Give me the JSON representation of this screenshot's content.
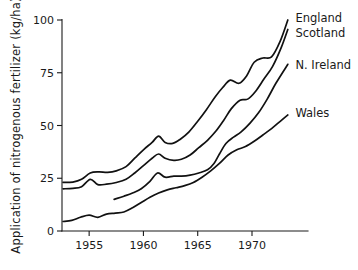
{
  "chart_data": {
    "type": "line",
    "title": "",
    "xlabel": "",
    "ylabel": "Application of nitrogenous fertilizer (kg/ha)",
    "xlim": [
      1952.5,
      1973.5
    ],
    "ylim": [
      0,
      100
    ],
    "xticks": [
      1955,
      1960,
      1965,
      1970
    ],
    "xtick_labels": [
      "1955",
      "1960",
      "1965",
      "1970"
    ],
    "yticks": [
      0,
      25,
      50,
      75,
      100
    ],
    "ytick_labels": [
      "0",
      "25",
      "50",
      "75",
      "100"
    ],
    "grid": false,
    "legend_position": "right-inline-labels",
    "line_color": "#111111",
    "series": [
      {
        "name": "England",
        "label": "England",
        "label_x": 1974.0,
        "label_y": 101.0,
        "x": [
          1952.6,
          1953.5,
          1954.3,
          1955.1,
          1955.9,
          1956.7,
          1957.5,
          1958.4,
          1959.2,
          1960.0,
          1960.8,
          1961.4,
          1962.0,
          1962.7,
          1963.4,
          1964.2,
          1965.0,
          1965.8,
          1966.6,
          1967.3,
          1968.0,
          1968.8,
          1969.5,
          1970.2,
          1971.0,
          1971.8,
          1972.6,
          1973.3
        ],
        "y": [
          23.0,
          23.2,
          24.5,
          27.5,
          28.0,
          27.8,
          28.5,
          30.5,
          34.5,
          38.5,
          42.0,
          45.0,
          42.0,
          41.5,
          43.5,
          47.0,
          52.0,
          57.5,
          63.5,
          68.0,
          71.5,
          70.0,
          73.5,
          80.0,
          82.0,
          82.5,
          90.0,
          100.0
        ]
      },
      {
        "name": "Scotland",
        "label": "Scotland",
        "label_x": 1974.0,
        "label_y": 94.0,
        "x": [
          1952.6,
          1953.5,
          1954.3,
          1955.1,
          1955.8,
          1956.6,
          1957.5,
          1958.4,
          1959.2,
          1960.0,
          1960.8,
          1961.4,
          1962.0,
          1962.8,
          1963.5,
          1964.3,
          1965.1,
          1965.9,
          1966.7,
          1967.4,
          1968.1,
          1968.9,
          1969.6,
          1970.3,
          1971.1,
          1971.9,
          1972.7,
          1973.3
        ],
        "y": [
          20.0,
          20.2,
          21.0,
          24.5,
          22.0,
          22.2,
          23.0,
          24.5,
          27.5,
          31.0,
          34.5,
          36.5,
          34.5,
          33.5,
          34.0,
          36.0,
          39.5,
          43.0,
          47.5,
          52.5,
          58.0,
          62.0,
          62.5,
          66.0,
          72.0,
          78.0,
          87.0,
          95.5
        ]
      },
      {
        "name": "N. Ireland",
        "label": "N. Ireland",
        "label_x": 1974.0,
        "label_y": 78.5,
        "x": [
          1957.3,
          1958.2,
          1959.0,
          1959.8,
          1960.6,
          1961.3,
          1962.0,
          1962.8,
          1963.5,
          1964.3,
          1965.1,
          1965.9,
          1966.5,
          1967.0,
          1967.6,
          1968.3,
          1969.0,
          1969.8,
          1970.6,
          1971.4,
          1972.2,
          1973.3
        ],
        "y": [
          15.0,
          16.5,
          18.0,
          20.0,
          23.5,
          27.5,
          25.5,
          26.0,
          26.0,
          26.5,
          27.5,
          29.0,
          32.0,
          36.5,
          41.5,
          44.5,
          47.0,
          51.0,
          56.0,
          62.5,
          70.0,
          79.0
        ]
      },
      {
        "name": "Wales",
        "label": "Wales",
        "label_x": 1974.0,
        "label_y": 56.0,
        "x": [
          1952.6,
          1953.4,
          1954.2,
          1955.0,
          1955.8,
          1956.6,
          1957.4,
          1958.2,
          1959.0,
          1959.8,
          1960.6,
          1961.4,
          1962.2,
          1963.0,
          1963.8,
          1964.6,
          1965.4,
          1966.2,
          1967.0,
          1967.8,
          1968.6,
          1969.4,
          1970.2,
          1971.0,
          1971.8,
          1972.6,
          1973.3
        ],
        "y": [
          4.5,
          5.0,
          6.5,
          7.5,
          6.5,
          8.0,
          8.5,
          9.0,
          11.0,
          13.5,
          16.0,
          18.0,
          19.5,
          20.5,
          21.5,
          23.0,
          25.5,
          28.5,
          32.0,
          36.0,
          38.5,
          40.0,
          42.5,
          45.5,
          48.5,
          52.0,
          55.0
        ]
      }
    ]
  }
}
